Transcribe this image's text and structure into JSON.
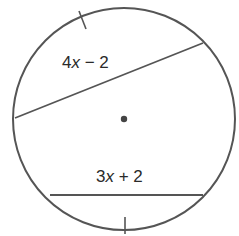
{
  "diagram": {
    "type": "circle-chords",
    "circle": {
      "cx": 124,
      "cy": 119,
      "r": 111,
      "stroke": "#555555"
    },
    "center_point": {
      "cx": 124,
      "cy": 119,
      "r": 3.2,
      "fill": "#444444"
    },
    "chords": [
      {
        "id": "upper",
        "x1": 15,
        "y1": 118,
        "x2": 203,
        "y2": 43,
        "label": "4x − 2"
      },
      {
        "id": "lower",
        "x1": 50,
        "y1": 195,
        "x2": 203,
        "y2": 195,
        "label": "3x + 2"
      }
    ],
    "tick_marks": [
      {
        "id": "top-arc-tick",
        "x1": 79,
        "y1": 11,
        "x2": 86,
        "y2": 29
      },
      {
        "id": "bottom-arc-tick",
        "x1": 125,
        "y1": 217,
        "x2": 125,
        "y2": 234
      }
    ],
    "labels": {
      "upper_chord": {
        "coef": "4",
        "var": "x",
        "rest": " − 2"
      },
      "lower_chord": {
        "coef": "3",
        "var": "x",
        "rest": " + 2"
      }
    }
  }
}
